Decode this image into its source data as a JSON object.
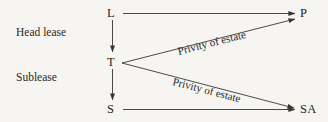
{
  "diagram": {
    "background_color": "#f6f5f2",
    "line_color": "#3a3732",
    "text_color": "#262420",
    "nodes": [
      {
        "id": "L",
        "label": "L",
        "role": "landlord"
      },
      {
        "id": "P",
        "label": "P",
        "role": "purchaser"
      },
      {
        "id": "T",
        "label": "T",
        "role": "tenant"
      },
      {
        "id": "S",
        "label": "S",
        "role": "subtenant"
      },
      {
        "id": "SA",
        "label": "SA",
        "role": "subtenant-assignee"
      }
    ],
    "side_labels": [
      {
        "id": "head-lease",
        "label": "Head lease"
      },
      {
        "id": "sublease",
        "label": "Sublease"
      }
    ],
    "edge_labels": [
      {
        "id": "privity-upper",
        "label": "Privity of estate",
        "from": "T",
        "to": "P"
      },
      {
        "id": "privity-lower",
        "label": "Privity of estate",
        "from": "T",
        "to": "SA"
      }
    ],
    "edges": [
      {
        "id": "L-to-P",
        "from": "L",
        "to": "P",
        "style": "horizontal",
        "arrow": "end"
      },
      {
        "id": "L-to-T",
        "from": "L",
        "to": "T",
        "style": "vertical",
        "arrow": "end"
      },
      {
        "id": "T-to-S",
        "from": "T",
        "to": "S",
        "style": "vertical",
        "arrow": "end"
      },
      {
        "id": "S-to-SA",
        "from": "S",
        "to": "SA",
        "style": "horizontal",
        "arrow": "end"
      },
      {
        "id": "T-to-P",
        "from": "T",
        "to": "P",
        "style": "diagonal-up",
        "arrow": "end"
      },
      {
        "id": "T-to-SA",
        "from": "T",
        "to": "SA",
        "style": "diagonal-down",
        "arrow": "end"
      }
    ]
  }
}
